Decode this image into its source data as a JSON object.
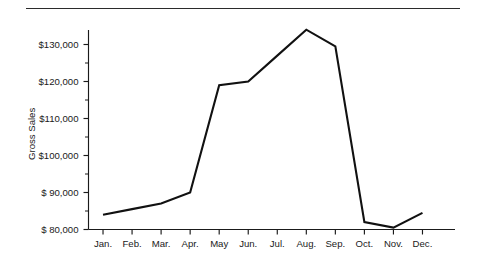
{
  "figure": {
    "background_color": "#ffffff",
    "rule_color": "#2b2b2b",
    "line_color": "#111111",
    "axis_color": "#1a1a1a"
  },
  "chart_data": {
    "type": "line",
    "title": "",
    "subtitle": "",
    "xlabel": "",
    "ylabel": "Gross Sales",
    "categories": [
      "Jan.",
      "Feb.",
      "Mar.",
      "Apr.",
      "May",
      "Jun.",
      "Jul.",
      "Aug.",
      "Sep.",
      "Oct.",
      "Nov.",
      "Dec."
    ],
    "series": [
      {
        "name": "Gross Sales",
        "values": [
          84000,
          85500,
          87000,
          90000,
          119000,
          120000,
          127000,
          134000,
          129500,
          82000,
          80500,
          84500
        ]
      }
    ],
    "ylim": [
      80000,
      135000
    ],
    "ytick_values": [
      80000,
      90000,
      100000,
      110000,
      120000,
      130000
    ],
    "ytick_labels": [
      "$ 80,000",
      "$ 90,000",
      "$100,000",
      "$110,000",
      "$120,000",
      "$130,000"
    ],
    "yminor_values": [
      85000,
      95000,
      105000,
      115000,
      125000,
      135000
    ],
    "grid": false,
    "legend": "none",
    "annotations": []
  }
}
